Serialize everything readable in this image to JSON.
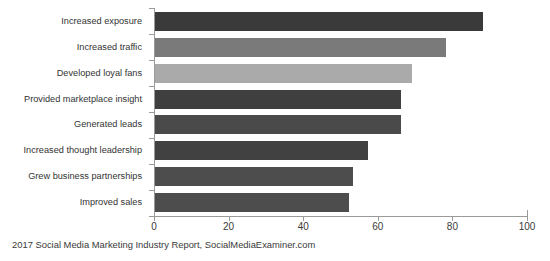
{
  "chart_data": {
    "type": "bar",
    "orientation": "horizontal",
    "title": "",
    "subtitle": "",
    "xlabel": "",
    "ylabel": "",
    "xlim": [
      0,
      100
    ],
    "xticks": [
      0,
      20,
      40,
      60,
      80,
      100
    ],
    "xtick_labels": [
      "0",
      "20",
      "40",
      "60",
      "80",
      "100"
    ],
    "grid": false,
    "legend": false,
    "categories": [
      "Increased exposure",
      "Increased traffic",
      "Developed loyal fans",
      "Provided marketplace insight",
      "Generated leads",
      "Increased thought leadership",
      "Grew business partnerships",
      "Improved sales"
    ],
    "values": [
      88,
      78,
      69,
      66,
      66,
      57,
      53,
      52
    ],
    "bar_colors": [
      "#3a3a3a",
      "#7a7a7a",
      "#aaaaaa",
      "#3f3f3f",
      "#4a4a4a",
      "#414141",
      "#4d4d4d",
      "#4d4d4d"
    ],
    "axis_color": "#9a9a9a",
    "background": "#ffffff"
  },
  "caption": {
    "text": "2017 Social Media Marketing Industry Report, SocialMediaExaminer.com"
  }
}
